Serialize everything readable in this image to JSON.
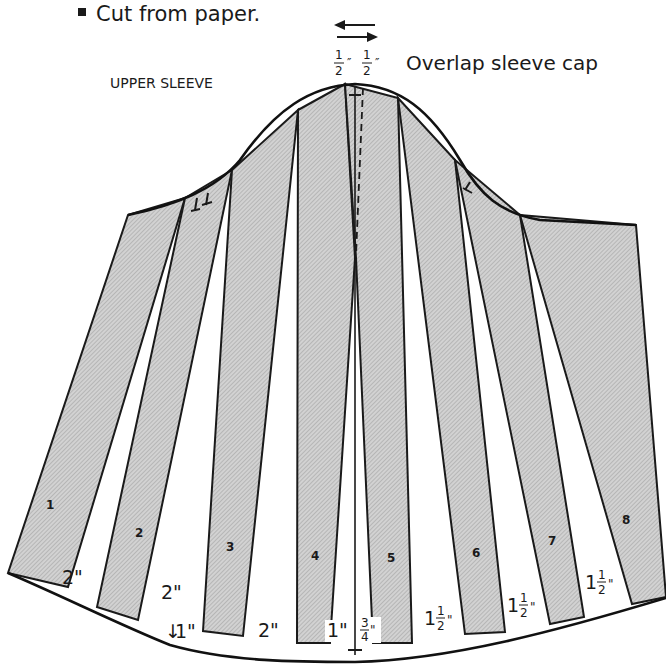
{
  "header": {
    "bullet_note": "Cut from paper.",
    "piece_label": "UPPER SLEEVE",
    "overlap_note": "Overlap sleeve cap",
    "overlap_left": "1/2\"",
    "overlap_right": "1/2\""
  },
  "colors": {
    "strip_fill": "#c9c9c9",
    "line": "#1a1a1a",
    "background": "#ffffff"
  },
  "strips": [
    {
      "number": "1"
    },
    {
      "number": "2"
    },
    {
      "number": "3"
    },
    {
      "number": "4"
    },
    {
      "number": "5"
    },
    {
      "number": "6"
    },
    {
      "number": "7"
    },
    {
      "number": "8"
    }
  ],
  "spread_measurements": [
    {
      "between": "1-2",
      "whole": "2",
      "frac_num": "",
      "frac_den": "",
      "unit": "\""
    },
    {
      "between": "2-3",
      "whole": "2",
      "frac_num": "",
      "frac_den": "",
      "unit": "\""
    },
    {
      "between": "2-3 hem",
      "whole": "1",
      "frac_num": "",
      "frac_den": "",
      "unit": "\""
    },
    {
      "between": "3-4",
      "whole": "2",
      "frac_num": "",
      "frac_den": "",
      "unit": "\""
    },
    {
      "between": "4-center",
      "whole": "1",
      "frac_num": "",
      "frac_den": "",
      "unit": "\""
    },
    {
      "between": "center-5",
      "whole": "",
      "frac_num": "3",
      "frac_den": "4",
      "unit": "\""
    },
    {
      "between": "5-6",
      "whole": "1",
      "frac_num": "1",
      "frac_den": "2",
      "unit": "\""
    },
    {
      "between": "6-7",
      "whole": "1",
      "frac_num": "1",
      "frac_den": "2",
      "unit": "\""
    },
    {
      "between": "7-8",
      "whole": "1",
      "frac_num": "1",
      "frac_den": "2",
      "unit": "\""
    }
  ],
  "icons": {
    "bullet": "square-bullet-icon",
    "overlap_arrows": "double-arrow-icon",
    "notches_single": "notch-icon",
    "notches_double": "double-notch-icon"
  }
}
